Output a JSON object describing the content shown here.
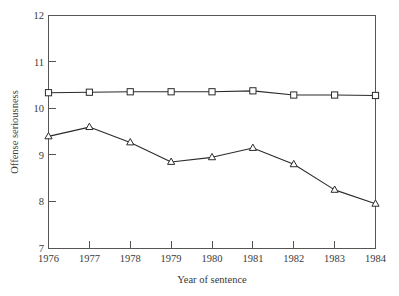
{
  "chart_data": {
    "type": "line",
    "title": "",
    "xlabel": "Year of sentence",
    "ylabel": "Offense seriousness",
    "x": [
      1976,
      1977,
      1978,
      1979,
      1980,
      1981,
      1982,
      1983,
      1984
    ],
    "xticklabels": [
      "1976",
      "1977",
      "1978",
      "1979",
      "1980",
      "1981",
      "1982",
      "1983",
      "1984"
    ],
    "yticklabels": [
      "7",
      "8",
      "9",
      "10",
      "11",
      "12"
    ],
    "yticks": [
      7,
      8,
      9,
      10,
      11,
      12
    ],
    "xlim": [
      1976,
      1984
    ],
    "ylim": [
      7,
      12
    ],
    "grid": false,
    "legend": "none",
    "series": [
      {
        "name": "series-squares",
        "marker": "open-square",
        "color": "#2b2b2b",
        "values": [
          10.34,
          10.35,
          10.36,
          10.36,
          10.36,
          10.38,
          10.29,
          10.29,
          10.28
        ]
      },
      {
        "name": "series-triangles",
        "marker": "open-triangle",
        "color": "#2b2b2b",
        "values": [
          9.4,
          9.6,
          9.27,
          8.85,
          8.95,
          9.15,
          8.8,
          8.25,
          7.95
        ]
      }
    ],
    "colors": {
      "line": "#2b2b2b",
      "axis": "#555555",
      "text": "#3a3a3a",
      "background": "#ffffff"
    }
  }
}
